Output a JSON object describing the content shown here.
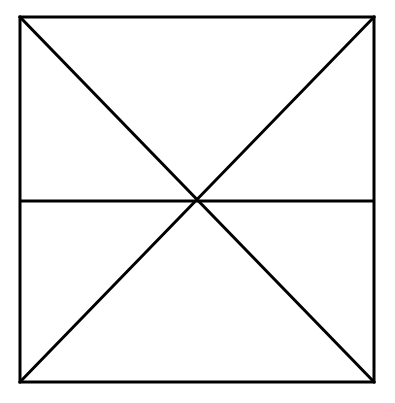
{
  "diagram": {
    "type": "geometric-figure",
    "stroke_color": "#000000",
    "background_color": "#ffffff",
    "stroke_width": 3,
    "square": {
      "top_left": [
        20,
        17
      ],
      "top_right": [
        374,
        17
      ],
      "bottom_right": [
        374,
        382
      ],
      "bottom_left": [
        20,
        382
      ]
    },
    "lines": [
      {
        "name": "diagonal-top-left-to-bottom-right",
        "x1": 20,
        "y1": 17,
        "x2": 374,
        "y2": 382
      },
      {
        "name": "diagonal-top-right-to-bottom-left",
        "x1": 374,
        "y1": 17,
        "x2": 20,
        "y2": 382
      },
      {
        "name": "horizontal-midline",
        "x1": 20,
        "y1": 201,
        "x2": 374,
        "y2": 201
      }
    ],
    "intersection": [
      197,
      201
    ]
  }
}
